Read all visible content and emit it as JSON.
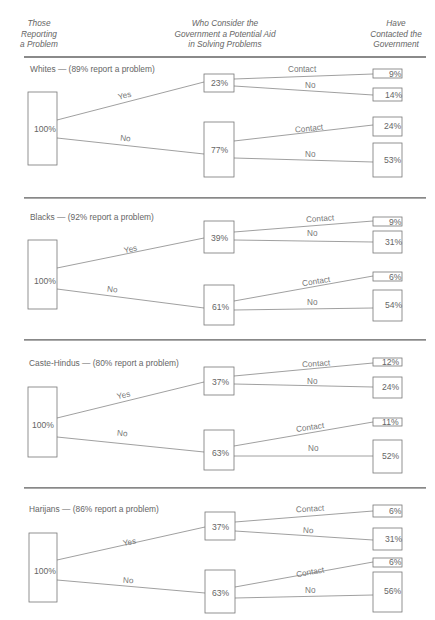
{
  "header": {
    "col1": [
      "Those",
      "Reporting",
      "a Problem"
    ],
    "col2": [
      "Who Consider the",
      "Government a Potential Aid",
      "in Solving Problems"
    ],
    "col3": [
      "Have",
      "Contacted the",
      "Government"
    ]
  },
  "sections": [
    {
      "title": "Whites — (89% report a problem)",
      "root": "100%",
      "yes_label": "Yes",
      "no_label": "No",
      "yes_value": "23%",
      "no_value": "77%",
      "yes_contact_label": "Contact",
      "yes_nocontact_label": "No",
      "no_contact_label": "Contact",
      "no_nocontact_label": "No",
      "yes_contact": "9%",
      "yes_nocontact": "14%",
      "no_contact": "24%",
      "no_nocontact": "53%"
    },
    {
      "title": "Blacks — (92% report a problem)",
      "root": "100%",
      "yes_label": "Yes",
      "no_label": "No",
      "yes_value": "39%",
      "no_value": "61%",
      "yes_contact_label": "Contact",
      "yes_nocontact_label": "No",
      "no_contact_label": "Contact",
      "no_nocontact_label": "No",
      "yes_contact": "9%",
      "yes_nocontact": "31%",
      "no_contact": "6%",
      "no_nocontact": "54%"
    },
    {
      "title": "Caste-Hindus — (80% report a problem)",
      "root": "100%",
      "yes_label": "Yes",
      "no_label": "No",
      "yes_value": "37%",
      "no_value": "63%",
      "yes_contact_label": "Contact",
      "yes_nocontact_label": "No",
      "no_contact_label": "Contact",
      "no_nocontact_label": "No",
      "yes_contact": "12%",
      "yes_nocontact": "24%",
      "no_contact": "11%",
      "no_nocontact": "52%"
    },
    {
      "title": "Harijans — (86% report a problem)",
      "root": "100%",
      "yes_label": "Yes",
      "no_label": "No",
      "yes_value": "37%",
      "no_value": "63%",
      "yes_contact_label": "Contact",
      "yes_nocontact_label": "No",
      "no_contact_label": "Contact",
      "no_nocontact_label": "No",
      "yes_contact": "6%",
      "yes_nocontact": "31%",
      "no_contact": "6%",
      "no_nocontact": "56%"
    }
  ]
}
